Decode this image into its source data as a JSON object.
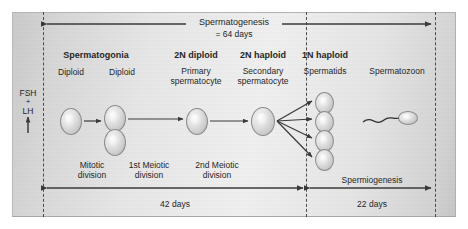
{
  "figure": {
    "top_axis": {
      "label": "Spermatogenesis",
      "duration": "= 64 days"
    },
    "hormones": {
      "fsh": "FSH",
      "plus": "+",
      "lh": "LH",
      "arrow": "up-arrow"
    },
    "stages": [
      {
        "ploidy": "Spermatogonia",
        "name": "Diploid",
        "name2": "Diploid"
      },
      {
        "ploidy": "2N diploid",
        "name_line1": "Primary",
        "name_line2": "spermatocyte"
      },
      {
        "ploidy": "2N haploid",
        "name_line1": "Secondary",
        "name_line2": "spermatocyte"
      },
      {
        "ploidy": "1N haploid",
        "name_line1": "Spermatids",
        "name_line2": ""
      },
      {
        "ploidy": "",
        "name_line1": "Spermatozoon",
        "name_line2": ""
      }
    ],
    "divisions": [
      {
        "line1": "Mitotic",
        "line2": "division"
      },
      {
        "line1": "1st Meiotic",
        "line2": "division"
      },
      {
        "line1": "2nd Meiotic",
        "line2": "division"
      }
    ],
    "bottom_axes": [
      {
        "label": "",
        "duration": "42 days"
      },
      {
        "label": "Spermiogenesis",
        "duration": "22 days"
      }
    ],
    "colors": {
      "line": "#3a3a3a",
      "panel_light": "#efefef",
      "panel_dark": "#c6c6c6",
      "text": "#262626"
    }
  }
}
